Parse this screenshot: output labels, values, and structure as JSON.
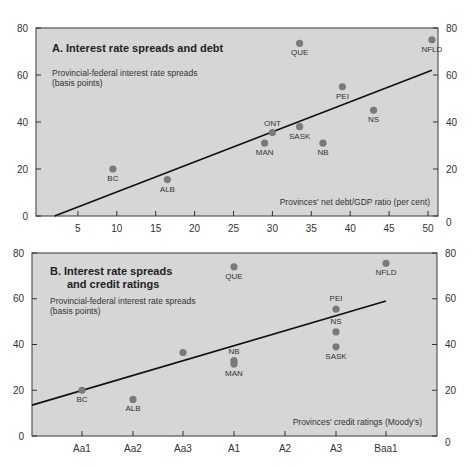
{
  "chart_data": [
    {
      "type": "scatter",
      "panel": "A",
      "title": "A.   Interest rate spreads and debt",
      "ylabel": [
        "Provincial-federal interest rate spreads",
        "(basis points)"
      ],
      "xlabel": "Provinces' net debt/GDP ratio (per cent)",
      "ylim": [
        0,
        80
      ],
      "yticks": [
        "0",
        "20",
        "40",
        "60",
        "80"
      ],
      "xlim": [
        0,
        52
      ],
      "xticks": [
        "5",
        "10",
        "15",
        "20",
        "25",
        "30",
        "35",
        "40",
        "45",
        "50"
      ],
      "grid": false,
      "points": [
        {
          "label": "BC",
          "x": 9.5,
          "y": 20
        },
        {
          "label": "ALB",
          "x": 16.5,
          "y": 15.5
        },
        {
          "label": "MAN",
          "x": 29,
          "y": 31
        },
        {
          "label": "ONT",
          "x": 30,
          "y": 35.5
        },
        {
          "label": "SASK",
          "x": 33.5,
          "y": 38
        },
        {
          "label": "NB",
          "x": 36.5,
          "y": 31
        },
        {
          "label": "NS",
          "x": 43,
          "y": 45
        },
        {
          "label": "PEI",
          "x": 39,
          "y": 55
        },
        {
          "label": "QUE",
          "x": 33.5,
          "y": 73.5
        },
        {
          "label": "NFLD",
          "x": 50.5,
          "y": 75
        }
      ],
      "trend_line": {
        "x": [
          2,
          50.5
        ],
        "y": [
          0,
          62
        ]
      }
    },
    {
      "type": "scatter",
      "panel": "B",
      "title": [
        "B.   Interest rate spreads",
        "and credit ratings"
      ],
      "ylabel": [
        "Provincial-federal interest rate spreads",
        "(basis points)"
      ],
      "xlabel": "Provinces' credit ratings (Moody's)",
      "ylim": [
        0,
        80
      ],
      "yticks": [
        "0",
        "20",
        "40",
        "60",
        "80"
      ],
      "categories": [
        "Aa1",
        "Aa2",
        "Aa3",
        "A1",
        "A2",
        "A3",
        "Baa1"
      ],
      "grid": false,
      "points": [
        {
          "label": "BC",
          "x": "Aa1",
          "y": 20
        },
        {
          "label": "ALB",
          "x": "Aa2",
          "y": 16
        },
        {
          "label": "",
          "x": "Aa3",
          "y": 36.5
        },
        {
          "label": "NB",
          "x": "A1",
          "y": 33
        },
        {
          "label": "MAN",
          "x": "A1",
          "y": 31.5
        },
        {
          "label": "QUE",
          "x": "A1",
          "y": 74
        },
        {
          "label": "PEI",
          "x": "A3",
          "y": 55.5
        },
        {
          "label": "NS",
          "x": "A3",
          "y": 45.5
        },
        {
          "label": "SASK",
          "x": "A3",
          "y": 39
        },
        {
          "label": "NFLD",
          "x": "Baa1",
          "y": 75.5
        }
      ],
      "trend_line": {
        "x": [
          "left edge",
          "Baa1"
        ],
        "y": [
          13.5,
          59
        ]
      }
    }
  ],
  "colors": {
    "plot_background": "#d6d6d6",
    "plot_border": "#555555",
    "point": "#7a7a7a",
    "trend_line": "#111111"
  }
}
